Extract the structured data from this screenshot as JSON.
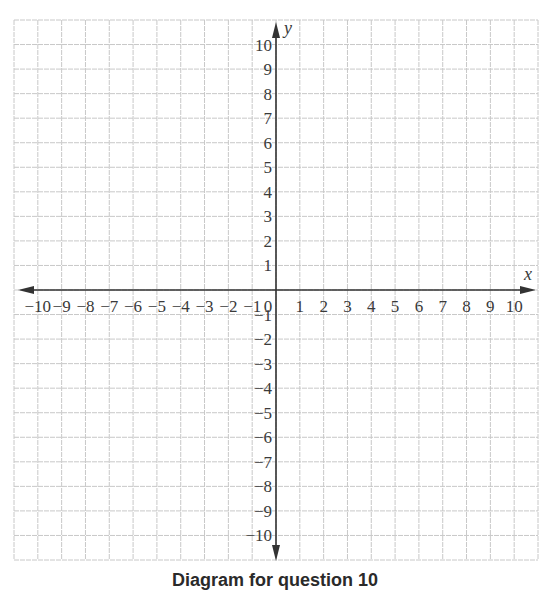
{
  "diagram": {
    "type": "coordinate-plane",
    "caption": "Diagram for question 10",
    "x_axis": {
      "name": "x",
      "min": -10,
      "max": 10,
      "tick_labels": [
        "−10",
        "−9",
        "−8",
        "−7",
        "−6",
        "−5",
        "−4",
        "−3",
        "−2",
        "−1",
        "0",
        "1",
        "2",
        "3",
        "4",
        "5",
        "6",
        "7",
        "8",
        "9",
        "10"
      ]
    },
    "y_axis": {
      "name": "y",
      "min": -10,
      "max": 10,
      "tick_labels_positive": [
        "1",
        "2",
        "3",
        "4",
        "5",
        "6",
        "7",
        "8",
        "9",
        "10"
      ],
      "tick_labels_negative": [
        "−1",
        "−2",
        "−3",
        "−4",
        "−5",
        "−6",
        "−7",
        "−8",
        "−9",
        "−10"
      ]
    },
    "grid": {
      "columns": 22,
      "rows": 22,
      "color": "#c8c8c8",
      "axis_color": "#333333"
    }
  }
}
